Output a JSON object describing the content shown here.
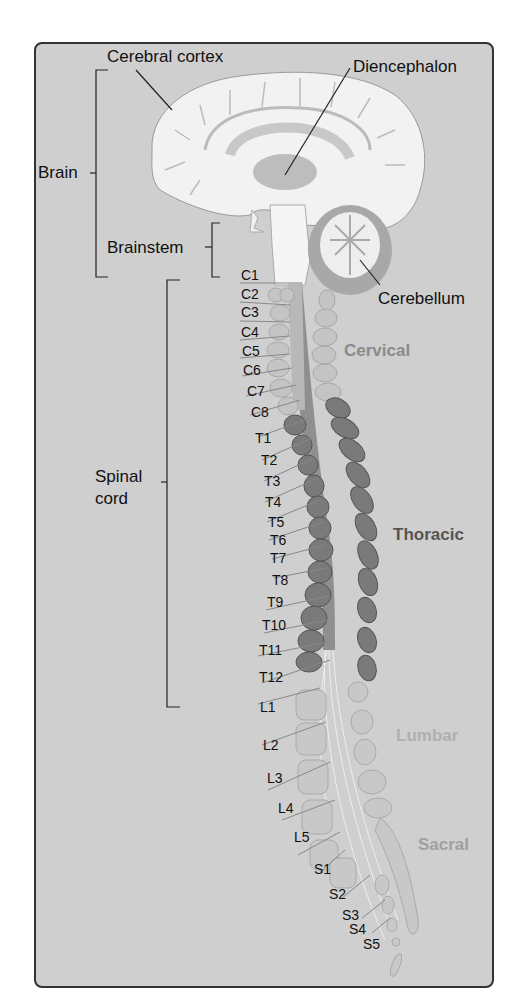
{
  "labels": {
    "cerebral_cortex": "Cerebral cortex",
    "diencephalon": "Diencephalon",
    "brain": "Brain",
    "brainstem": "Brainstem",
    "cerebellum": "Cerebellum",
    "spinal_cord_line1": "Spinal",
    "spinal_cord_line2": "cord"
  },
  "regions": {
    "cervical": "Cervical",
    "thoracic": "Thoracic",
    "lumbar": "Lumbar",
    "sacral": "Sacral"
  },
  "segments": {
    "cervical": [
      "C1",
      "C2",
      "C3",
      "C4",
      "C5",
      "C6",
      "C7",
      "C8"
    ],
    "thoracic": [
      "T1",
      "T2",
      "T3",
      "T4",
      "T5",
      "T6",
      "T7",
      "T8",
      "T9",
      "T10",
      "T11",
      "T12"
    ],
    "lumbar": [
      "L1",
      "L2",
      "L3",
      "L4",
      "L5"
    ],
    "sacral": [
      "S1",
      "S2",
      "S3",
      "S4",
      "S5"
    ]
  },
  "colors": {
    "background": "#cfcfcf",
    "brain": "#f2f2f2",
    "cervical_vertebra": "#c4c4c4",
    "thoracic_vertebra": "#7a7a7a",
    "lumbar_vertebra": "#c8c8c8",
    "cervical_text": "#8a8a8a",
    "thoracic_text": "#555555",
    "lumbar_text": "#b0b0b0",
    "sacral_text": "#a0a0a0"
  }
}
